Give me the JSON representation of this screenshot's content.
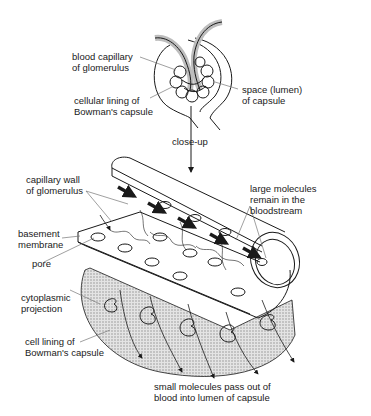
{
  "diagram": {
    "labels": {
      "blood_capillary": [
        "blood capillary",
        "of glomerulus"
      ],
      "cellular_lining": [
        "cellular lining of",
        "Bowman's capsule"
      ],
      "space_lumen": [
        "space (lumen)",
        "of capsule"
      ],
      "close_up": "close-up",
      "capillary_wall": [
        "capillary wall",
        "of glomerulus"
      ],
      "large_molecules": [
        "large molecules",
        "remain in the",
        "bloodstream"
      ],
      "basement_membrane": [
        "basement",
        "membrane"
      ],
      "pore": "pore",
      "cytoplasmic_projection": [
        "cytoplasmic",
        "projection"
      ],
      "cell_lining": [
        "cell lining of",
        "Bowman's capsule"
      ],
      "small_molecules": [
        "small molecules pass out of",
        "blood into lumen of capsule"
      ]
    },
    "colors": {
      "ink": "#1a1a1a",
      "shading": "#cfcfcf",
      "leader": "#777777",
      "background": "#ffffff"
    }
  }
}
